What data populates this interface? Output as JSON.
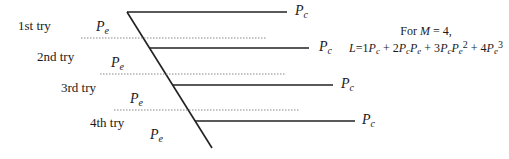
{
  "tries": [
    {
      "label": "1st try",
      "pe": "P",
      "pe_sub": "e",
      "pc": "P",
      "pc_sub": "c"
    },
    {
      "label": "2nd try",
      "pe": "P",
      "pe_sub": "e",
      "pc": "P",
      "pc_sub": "c"
    },
    {
      "label": "3rd try",
      "pe": "P",
      "pe_sub": "e",
      "pc": "P",
      "pc_sub": "c"
    },
    {
      "label": "4th try",
      "pe": "P",
      "pe_sub": "e",
      "pc": "P",
      "pc_sub": "c"
    }
  ],
  "final_pe": {
    "p": "P",
    "sub": "e"
  },
  "formula": {
    "line1_prefix": "For ",
    "line1_var": "M",
    "line1_suffix": " = 4,",
    "line2": {
      "lhs": "L",
      "eq": "=1",
      "t1": "P",
      "t1s": "c",
      "plus1": " + 2",
      "t2a": "P",
      "t2as": "c",
      "t2b": "P",
      "t2bs": "e",
      "plus2": " + 3",
      "t3a": "P",
      "t3as": "c",
      "t3b": "P",
      "t3bs": "e",
      "t3exp": "2",
      "plus3": " + 4",
      "t4": "P",
      "t4s": "e",
      "t4exp": "3"
    }
  },
  "colors": {
    "line": "#222222",
    "dotted": "#888888"
  }
}
